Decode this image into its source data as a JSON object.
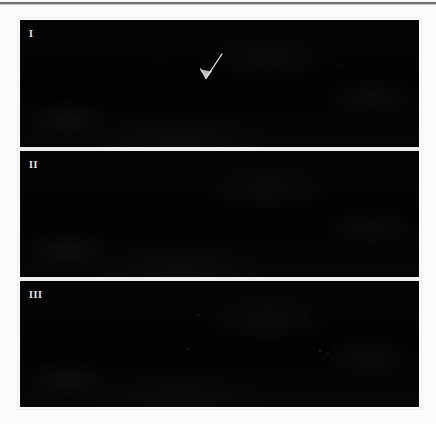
{
  "figure": {
    "background_color": "#fbfbfa",
    "panel_color": "#040404",
    "label_color": "#e8e8e6",
    "rule_color": "#6e6e6e",
    "panels": [
      {
        "label": "I",
        "name": "panel-i",
        "annotation": {
          "type": "arrow",
          "label": "arrow-annotation",
          "direction": "down-left",
          "color": "#e6e6e4"
        }
      },
      {
        "label": "II",
        "name": "panel-ii",
        "annotation": null
      },
      {
        "label": "III",
        "name": "panel-iii",
        "annotation": null
      }
    ]
  }
}
